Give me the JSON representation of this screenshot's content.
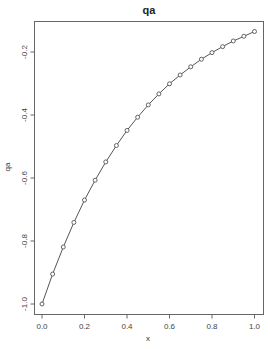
{
  "chart_data": {
    "type": "line",
    "title": "qa",
    "xlabel": "x",
    "ylabel": "qa",
    "xlim": [
      0.0,
      1.0
    ],
    "ylim": [
      -1.0,
      -0.14
    ],
    "grid": false,
    "legend": null,
    "x_ticks": [
      "0.0",
      "0.2",
      "0.4",
      "0.6",
      "0.8",
      "1.0"
    ],
    "x_tick_values": [
      0.0,
      0.2,
      0.4,
      0.6,
      0.8,
      1.0
    ],
    "y_ticks": [
      "-1.0",
      "-0.8",
      "-0.6",
      "-0.4",
      "-0.2"
    ],
    "y_tick_values": [
      -1.0,
      -0.8,
      -0.6,
      -0.4,
      -0.2
    ],
    "markers": "open-circle",
    "series": [
      {
        "name": "qa",
        "x": [
          0.0,
          0.05,
          0.1,
          0.15,
          0.2,
          0.25,
          0.3,
          0.35,
          0.4,
          0.45,
          0.5,
          0.55,
          0.6,
          0.65,
          0.7,
          0.75,
          0.8,
          0.85,
          0.9,
          0.95,
          1.0
        ],
        "values": [
          -1.0,
          -0.905,
          -0.819,
          -0.741,
          -0.67,
          -0.607,
          -0.549,
          -0.497,
          -0.449,
          -0.407,
          -0.368,
          -0.333,
          -0.301,
          -0.273,
          -0.247,
          -0.223,
          -0.202,
          -0.183,
          -0.165,
          -0.15,
          -0.135
        ]
      }
    ],
    "colors": {
      "line": "#555555",
      "marker": "#555555",
      "frame": "#666666"
    }
  }
}
